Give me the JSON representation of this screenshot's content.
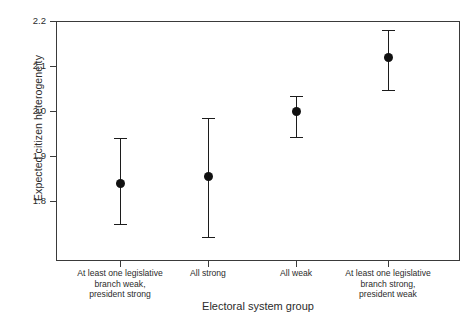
{
  "chart_data": {
    "type": "scatter",
    "title": "",
    "xlabel": "Electoral system group",
    "ylabel": "Expected citizen heterogeneity",
    "ylim": [
      1.73,
      2.22
    ],
    "yticks": [
      1.8,
      1.9,
      2.0,
      2.1,
      2.2
    ],
    "ytick_labels": [
      "1.8",
      "1.9",
      "2.0",
      "2.1",
      "2.2"
    ],
    "grid": false,
    "legend": "none",
    "categories": [
      "At least one legislative\nbranch weak,\npresident strong",
      "All strong",
      "All weak",
      "At least one legislative\nbranch strong,\npresident weak"
    ],
    "category_lines": [
      [
        "At least one legislative",
        "branch weak,",
        "president strong"
      ],
      [
        "All strong",
        "",
        ""
      ],
      [
        "All weak",
        "",
        ""
      ],
      [
        "At least one legislative",
        "branch strong,",
        "president weak"
      ]
    ],
    "values": [
      1.84,
      1.855,
      2.0,
      2.12
    ],
    "error_low": [
      1.75,
      1.72,
      1.942,
      2.047
    ],
    "error_high": [
      1.94,
      1.985,
      2.033,
      2.18
    ],
    "marker": "filled-circle",
    "marker_color": "#111111",
    "errorbar_color": "#1c1c1c",
    "axis_color": "#3a3a3a",
    "background": "#ffffff"
  },
  "axes": {
    "ytick_0": "1.8",
    "ytick_1": "1.9",
    "ytick_2": "2.0",
    "ytick_3": "2.1",
    "ytick_4": "2.2",
    "x_title": "Electoral system group",
    "y_title": "Expected citizen heterogeneity"
  },
  "xlabels": {
    "c0l0": "At least one legislative",
    "c0l1": "branch weak,",
    "c0l2": "president strong",
    "c1l0": "All strong",
    "c2l0": "All weak",
    "c3l0": "At least one legislative",
    "c3l1": "branch strong,",
    "c3l2": "president weak"
  }
}
